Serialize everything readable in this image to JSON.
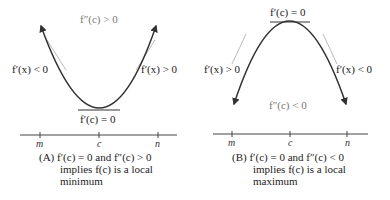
{
  "panels": [
    {
      "id": "A",
      "type": "local-minimum",
      "second_derivative_label": "f″(c) > 0",
      "left_slope_label": "f′(x) < 0",
      "right_slope_label": "f′(x) > 0",
      "critical_label": "f′(c) = 0",
      "axis_ticks": [
        "m",
        "c",
        "n"
      ],
      "caption_prefix": "(A)",
      "caption_line1": "f′(c) = 0 and f″(c) > 0",
      "caption_line2": "implies f(c) is a local",
      "caption_line3": "minimum"
    },
    {
      "id": "B",
      "type": "local-maximum",
      "second_derivative_label": "f″(c) < 0",
      "left_slope_label": "f′(x) > 0",
      "right_slope_label": "f′(x) < 0",
      "critical_label": "f′(c) = 0",
      "axis_ticks": [
        "m",
        "c",
        "n"
      ],
      "caption_prefix": "(B)",
      "caption_line1": "f′(c) = 0 and f″(c) < 0",
      "caption_line2": "implies f(c) is a local",
      "caption_line3": "maximum"
    }
  ],
  "colors": {
    "curve": "#333333",
    "tangent": "#999999",
    "axis": "#444444",
    "concavity_label": "#777777"
  }
}
